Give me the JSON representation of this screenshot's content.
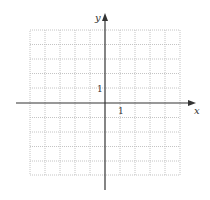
{
  "diagram": {
    "type": "coordinate-grid",
    "axes": {
      "x_label": "x",
      "y_label": "y",
      "x_tick_label": "1",
      "y_tick_label": "1"
    },
    "grid": {
      "columns": 10,
      "rows": 10,
      "x_range": [
        -5,
        5
      ],
      "y_range": [
        -5,
        5
      ],
      "line_style": "dotted",
      "grid_color": "#bbbbbb",
      "axis_color": "#333333"
    }
  }
}
